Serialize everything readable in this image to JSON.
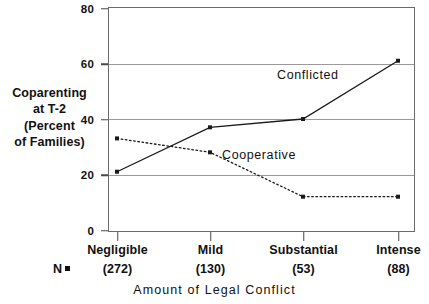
{
  "chart_data": {
    "type": "line",
    "title": "",
    "xlabel": "Amount of Legal Conflict",
    "ylabel": "Coparenting at T-2 (Percent of Families)",
    "categories": [
      "Negligible",
      "Mild",
      "Substantial",
      "Intense"
    ],
    "group_sizes": [
      "(272)",
      "(130)",
      "(53)",
      "(88)"
    ],
    "group_size_legend": "N",
    "ylim": [
      0,
      80
    ],
    "yticks": [
      0,
      20,
      40,
      60,
      80
    ],
    "ytick_labels": [
      "0",
      "20",
      "40",
      "60",
      "80"
    ],
    "grid": true,
    "legend_position": "inline-annotations",
    "series": [
      {
        "name": "Conflicted",
        "style": "solid",
        "color": "#1a1a1a",
        "values": [
          21,
          37,
          40,
          61
        ]
      },
      {
        "name": "Cooperative",
        "style": "dotted",
        "color": "#1a1a1a",
        "values": [
          33,
          28,
          12,
          12
        ]
      }
    ]
  },
  "y_axis_title_lines": [
    "Coparenting",
    "at T-2",
    "(Percent",
    "of Families)"
  ]
}
